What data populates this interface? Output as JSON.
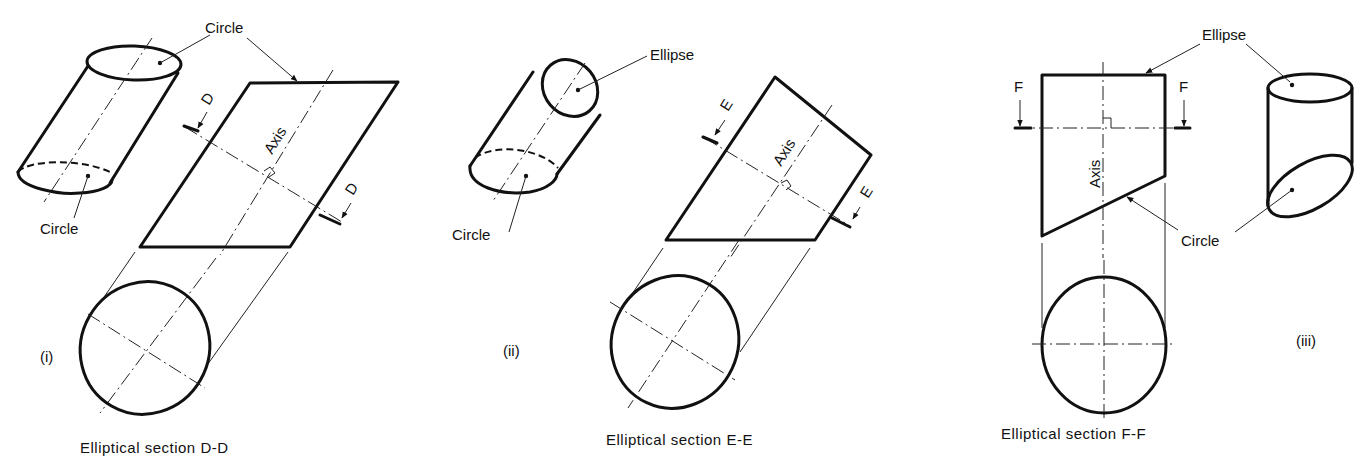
{
  "figure": {
    "panels": [
      {
        "id": "i",
        "roman": "(i)",
        "caption": "Elliptical section  D-D",
        "section_letter": "D",
        "axis_label": "Axis",
        "labels": {
          "top_face": "Circle",
          "bottom_face": "Circle",
          "cut_edge": "Circle"
        }
      },
      {
        "id": "ii",
        "roman": "(ii)",
        "caption": "Elliptical section  E-E",
        "section_letter": "E",
        "axis_label": "Axis",
        "labels": {
          "top_face": "Ellipse",
          "bottom_face": "Circle"
        }
      },
      {
        "id": "iii",
        "roman": "(iii)",
        "caption": "Elliptical section  F-F",
        "section_letter": "F",
        "axis_label": "Axis",
        "labels": {
          "top_face": "Ellipse",
          "bottom_face": "Circle"
        }
      }
    ]
  }
}
